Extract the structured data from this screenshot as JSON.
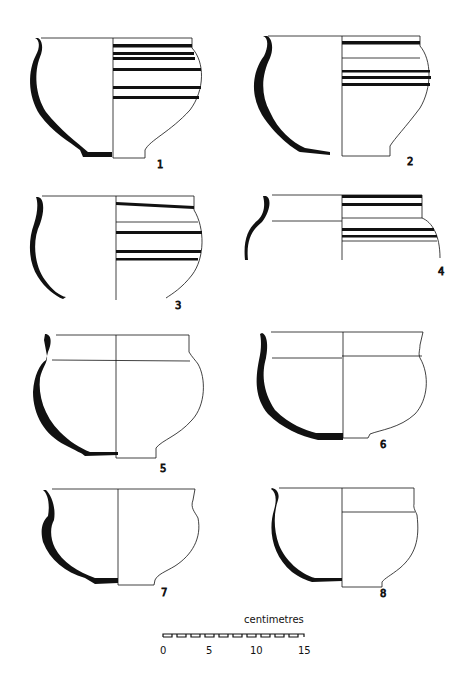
{
  "figure": {
    "vessels": [
      {
        "number": "1",
        "decoration": "horizontal bands"
      },
      {
        "number": "2",
        "decoration": "horizontal bands"
      },
      {
        "number": "3",
        "decoration": "horizontal bands"
      },
      {
        "number": "4",
        "decoration": "horizontal bands"
      },
      {
        "number": "5",
        "decoration": "plain"
      },
      {
        "number": "6",
        "decoration": "plain"
      },
      {
        "number": "7",
        "decoration": "plain"
      },
      {
        "number": "8",
        "decoration": "plain"
      }
    ],
    "scale": {
      "unit_label": "centimetres",
      "ticks": [
        "0",
        "5",
        "10",
        "15"
      ]
    }
  },
  "colors": {
    "ink": "#111111",
    "paper": "#ffffff"
  }
}
